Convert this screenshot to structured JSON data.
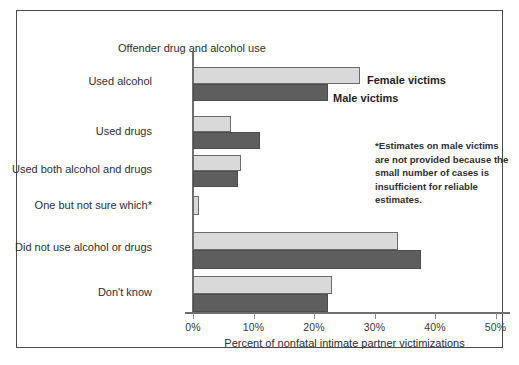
{
  "chart_data": {
    "type": "bar",
    "orientation": "horizontal",
    "title": "Offender drug and alcohol use",
    "xlabel": "Percent of nonfatal intimate partner victimizations",
    "ylabel": "",
    "xlim": [
      0,
      50
    ],
    "xticks": [
      "0%",
      "10%",
      "20%",
      "30%",
      "40%",
      "50%"
    ],
    "xtick_values": [
      0,
      10,
      20,
      30,
      40,
      50
    ],
    "grid": false,
    "legend_position": "inline-annotation",
    "categories": [
      "Used alcohol",
      "Used drugs",
      "Used both alcohol and drugs",
      "One but not sure which*",
      "Did not use alcohol or drugs",
      "Don't know"
    ],
    "series": [
      {
        "name": "Female victims",
        "color": "#d9d9d9",
        "values": [
          27.6,
          6.2,
          8.0,
          1.0,
          33.8,
          23.0
        ]
      },
      {
        "name": "Male victims",
        "color": "#5e5e5e",
        "values": [
          22.3,
          11.0,
          7.4,
          null,
          37.6,
          22.2
        ]
      }
    ],
    "annotations": [
      "*Estimates on male victims are not provided because the small number of cases is insufficient for reliable estimates."
    ]
  },
  "chart": {
    "title": "Offender drug and alcohol use",
    "axis_title": "Percent of nonfatal intimate partner victimizations",
    "footnote": "*Estimates on male victims are not provided because the small number of cases is insufficient for reliable estimates.",
    "series_labels": {
      "female": "Female victims",
      "male": "Male victims"
    },
    "ticks": [
      "0%",
      "10%",
      "20%",
      "30%",
      "40%",
      "50%"
    ],
    "categories": [
      "Used alcohol",
      "Used drugs",
      "Used both alcohol and drugs",
      "One but not sure which*",
      "Did not use alcohol or drugs",
      "Don't know"
    ],
    "colors": {
      "female_bar": "#d9d9d9",
      "male_bar": "#5e5e5e",
      "border": "#4a4a4a",
      "axis": "#6f6f6f",
      "text": "#2f2f2f"
    }
  }
}
